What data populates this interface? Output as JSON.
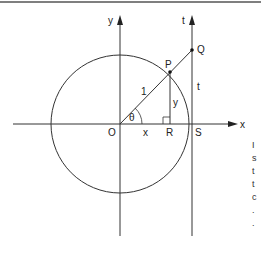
{
  "diagram": {
    "type": "unit-circle-trig-diagram",
    "labels": {
      "y_axis": "y",
      "t_axis": "t",
      "x_axis": "x",
      "origin": "O",
      "point_P": "P",
      "point_Q": "Q",
      "point_R": "R",
      "point_S": "S",
      "radius": "1",
      "angle": "θ",
      "segment_OR": "x",
      "segment_PR": "y",
      "segment_SQ": "t"
    },
    "side_text_fragments": [
      "I",
      "s",
      "t",
      "t",
      "c",
      ".",
      "."
    ],
    "colors": {
      "line": "#333333",
      "background": "#ffffff"
    }
  }
}
